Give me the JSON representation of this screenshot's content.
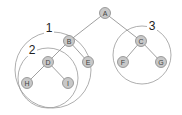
{
  "diagram": {
    "type": "binary-tree-subtrees",
    "nodes": [
      {
        "id": "A",
        "label": "A",
        "x": 105,
        "y": 13
      },
      {
        "id": "B",
        "label": "B",
        "x": 69,
        "y": 41
      },
      {
        "id": "C",
        "label": "C",
        "x": 141,
        "y": 41
      },
      {
        "id": "D",
        "label": "D",
        "x": 48,
        "y": 62
      },
      {
        "id": "E",
        "label": "E",
        "x": 88,
        "y": 62
      },
      {
        "id": "F",
        "label": "F",
        "x": 123,
        "y": 62
      },
      {
        "id": "G",
        "label": "G",
        "x": 161,
        "y": 62
      },
      {
        "id": "H",
        "label": "H",
        "x": 27,
        "y": 83
      },
      {
        "id": "I",
        "label": "I",
        "x": 68,
        "y": 83
      }
    ],
    "edges": [
      [
        "A",
        "B"
      ],
      [
        "A",
        "C"
      ],
      [
        "B",
        "D"
      ],
      [
        "B",
        "E"
      ],
      [
        "C",
        "F"
      ],
      [
        "C",
        "G"
      ],
      [
        "D",
        "H"
      ],
      [
        "D",
        "I"
      ]
    ],
    "groups": [
      {
        "label": "1",
        "cx": 53,
        "cy": 70,
        "r": 38,
        "label_x": 49,
        "label_y": 28
      },
      {
        "label": "2",
        "cx": 48,
        "cy": 78,
        "r": 30,
        "label_x": 32,
        "label_y": 50
      },
      {
        "label": "3",
        "cx": 142,
        "cy": 55,
        "r": 29,
        "label_x": 152,
        "label_y": 26
      }
    ],
    "colors": {
      "node_fill": "#c8c8c8",
      "node_stroke": "#888888",
      "edge": "#888888",
      "circle": "#999999"
    }
  }
}
